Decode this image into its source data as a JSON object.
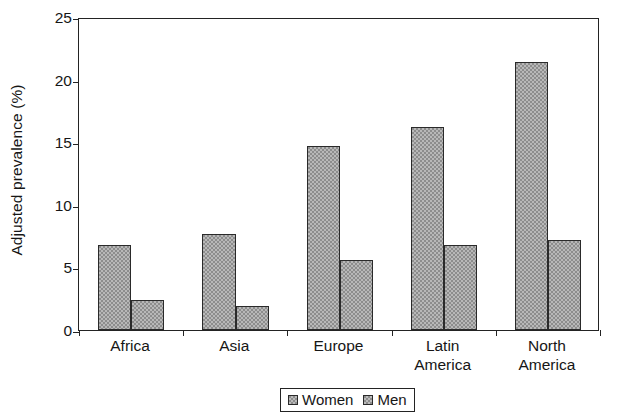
{
  "chart_data": {
    "type": "bar",
    "title": "",
    "xlabel": "",
    "ylabel": "Adjusted prevalence (%)",
    "ylim": [
      0,
      25
    ],
    "ytick_values": [
      0,
      5,
      10,
      15,
      20,
      25
    ],
    "ytick_labels": [
      "0",
      "5",
      "10",
      "15",
      "20",
      "25"
    ],
    "grid": false,
    "legend_position": "bottom-center",
    "categories": [
      "Africa",
      "Asia",
      "Europe",
      "Latin America",
      "North America"
    ],
    "category_label_lines": [
      [
        "Africa"
      ],
      [
        "Asia"
      ],
      [
        "Europe"
      ],
      [
        "Latin",
        "America"
      ],
      [
        "North",
        "America"
      ]
    ],
    "series": [
      {
        "name": "Women",
        "color": "#8d8d8d",
        "values": [
          6.8,
          7.7,
          14.7,
          16.2,
          21.4
        ]
      },
      {
        "name": "Men",
        "color": "#8d8d8d",
        "values": [
          2.4,
          1.9,
          5.6,
          6.8,
          7.2
        ]
      }
    ],
    "legend_entries": [
      {
        "label": "Women",
        "swatch": "hatched-gray-square"
      },
      {
        "label": "Men",
        "swatch": "hatched-gray-square"
      }
    ]
  },
  "figure": {
    "axis_color": "#232323",
    "bar_fill": "#8d8d8d",
    "bar_edge": "#2a2a2a",
    "background": "#ffffff"
  }
}
